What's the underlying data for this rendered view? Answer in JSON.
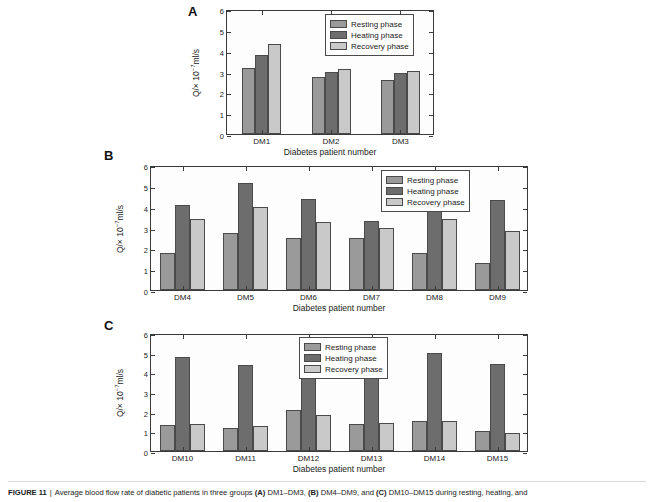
{
  "figure": {
    "label": "FIGURE 11",
    "separator": "|",
    "caption": "Average blood flow rate of diabetic patients in three groups",
    "caption_a_tag": "(A)",
    "caption_a_text": "DM1–DM3,",
    "caption_b_tag": "(B)",
    "caption_b_text": "DM4–DM9, and",
    "caption_c_tag": "(C)",
    "caption_c_text": "DM10–DM15 during resting, heating, and"
  },
  "colors": {
    "resting": "#9a9a9a",
    "heating": "#6d6d6d",
    "recovery": "#c9c9c9",
    "axis": "#3a3a3a",
    "background": "#ffffff"
  },
  "legend": {
    "items": [
      {
        "label": "Resting phase",
        "color": "#9a9a9a"
      },
      {
        "label": "Heating phase",
        "color": "#6d6d6d"
      },
      {
        "label": "Recovery phase",
        "color": "#c9c9c9"
      }
    ]
  },
  "axis": {
    "y_title_prefix": "Q/× 10",
    "y_title_exp": "−7",
    "y_title_suffix": "ml/s",
    "x_title": "Diabetes patient number",
    "y_ticks": [
      "0",
      "1",
      "2",
      "3",
      "4",
      "5",
      "6"
    ]
  },
  "panels": [
    {
      "letter": "A"
    },
    {
      "letter": "B"
    },
    {
      "letter": "C"
    }
  ],
  "chart_data": [
    {
      "type": "bar",
      "panel": "A",
      "title": "",
      "xlabel": "Diabetes patient number",
      "ylabel": "Q/× 10⁻⁷ml/s",
      "ylim": [
        0,
        6
      ],
      "yticks": [
        0,
        1,
        2,
        3,
        4,
        5,
        6
      ],
      "grid": false,
      "legend_position": "upper right",
      "categories": [
        "DM1",
        "DM2",
        "DM3"
      ],
      "series": [
        {
          "name": "Resting phase",
          "color": "#9a9a9a",
          "values": [
            3.18,
            2.72,
            2.58
          ]
        },
        {
          "name": "Heating phase",
          "color": "#6d6d6d",
          "values": [
            3.78,
            2.98,
            2.92
          ]
        },
        {
          "name": "Recovery phase",
          "color": "#c9c9c9",
          "values": [
            4.3,
            3.1,
            3.02
          ]
        }
      ]
    },
    {
      "type": "bar",
      "panel": "B",
      "title": "",
      "xlabel": "Diabetes patient number",
      "ylabel": "Q/× 10⁻⁷ml/s",
      "ylim": [
        0,
        6
      ],
      "yticks": [
        0,
        1,
        2,
        3,
        4,
        5,
        6
      ],
      "grid": false,
      "legend_position": "upper right",
      "categories": [
        "DM4",
        "DM5",
        "DM6",
        "DM7",
        "DM8",
        "DM9"
      ],
      "series": [
        {
          "name": "Resting phase",
          "color": "#9a9a9a",
          "values": [
            1.78,
            2.73,
            2.51,
            2.5,
            1.78,
            1.3
          ]
        },
        {
          "name": "Heating phase",
          "color": "#6d6d6d",
          "values": [
            4.1,
            5.13,
            4.36,
            3.29,
            4.1,
            4.33
          ]
        },
        {
          "name": "Recovery phase",
          "color": "#c9c9c9",
          "values": [
            3.41,
            3.97,
            3.27,
            2.96,
            3.42,
            2.82
          ]
        }
      ]
    },
    {
      "type": "bar",
      "panel": "C",
      "title": "",
      "xlabel": "Diabetes patient number",
      "ylabel": "Q/× 10⁻⁷ml/s",
      "ylim": [
        0,
        6
      ],
      "yticks": [
        0,
        1,
        2,
        3,
        4,
        5,
        6
      ],
      "grid": false,
      "legend_position": "upper center",
      "categories": [
        "DM10",
        "DM11",
        "DM12",
        "DM13",
        "DM14",
        "DM15"
      ],
      "series": [
        {
          "name": "Resting phase",
          "color": "#9a9a9a",
          "values": [
            1.31,
            1.15,
            2.08,
            1.38,
            1.52,
            1.03
          ]
        },
        {
          "name": "Heating phase",
          "color": "#6d6d6d",
          "values": [
            4.79,
            4.37,
            4.52,
            3.86,
            4.99,
            4.41
          ]
        },
        {
          "name": "Recovery phase",
          "color": "#c9c9c9",
          "values": [
            1.36,
            1.26,
            1.83,
            1.42,
            1.52,
            0.93
          ]
        }
      ]
    }
  ]
}
